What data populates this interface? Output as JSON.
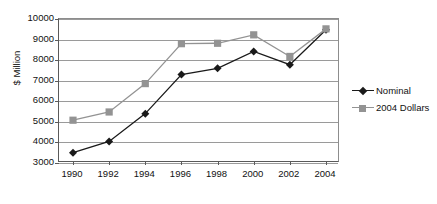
{
  "chart_data": {
    "type": "line",
    "title": "",
    "xlabel": "",
    "ylabel": "$ Million",
    "categories": [
      "1990",
      "1992",
      "1994",
      "1996",
      "1998",
      "2000",
      "2002",
      "2004"
    ],
    "x": [
      1990,
      1992,
      1994,
      1996,
      1998,
      2000,
      2002,
      2004
    ],
    "ylim": [
      3000,
      10000
    ],
    "ytick_labels": [
      "10000",
      "9000",
      "8000",
      "7000",
      "6000",
      "5000",
      "4000",
      "3000"
    ],
    "ytick_values": [
      10000,
      9000,
      8000,
      7000,
      6000,
      5000,
      4000,
      3000
    ],
    "grid": true,
    "legend_position": "right",
    "series": [
      {
        "name": "Nominal",
        "color": "#1a1a1a",
        "marker": "diamond",
        "values": [
          3500,
          4050,
          5400,
          7300,
          7600,
          8420,
          7780,
          9480
        ]
      },
      {
        "name": "2004 Dollars",
        "color": "#939393",
        "marker": "square",
        "values": [
          5080,
          5480,
          6860,
          8800,
          8820,
          9230,
          8180,
          9520
        ]
      }
    ]
  },
  "legend": {
    "entries": [
      {
        "label": "Nominal"
      },
      {
        "label": "2004 Dollars"
      }
    ]
  },
  "colors": {
    "nominal": "#1a1a1a",
    "dollars_2004": "#939393",
    "gridline": "#9a9a9a",
    "axis": "#5a5a5a",
    "background": "#ffffff"
  }
}
